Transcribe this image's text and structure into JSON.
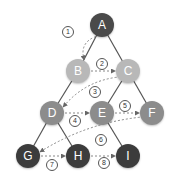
{
  "diagram": {
    "type": "tree-bfs-traversal",
    "colors": {
      "level0": "#4a4a4a",
      "level1": "#b8b8b8",
      "level2": "#8c8c8c",
      "level3": "#3c3c3c",
      "edge": "#555555",
      "arrow": "#888888"
    },
    "nodes": [
      {
        "id": "A",
        "label": "A",
        "x": 102,
        "y": 25,
        "level": 0
      },
      {
        "id": "B",
        "label": "B",
        "x": 78,
        "y": 71,
        "level": 1
      },
      {
        "id": "C",
        "label": "C",
        "x": 128,
        "y": 71,
        "level": 1
      },
      {
        "id": "D",
        "label": "D",
        "x": 52,
        "y": 113,
        "level": 2
      },
      {
        "id": "E",
        "label": "E",
        "x": 102,
        "y": 113,
        "level": 2
      },
      {
        "id": "F",
        "label": "F",
        "x": 152,
        "y": 113,
        "level": 2
      },
      {
        "id": "G",
        "label": "G",
        "x": 28,
        "y": 156,
        "level": 3
      },
      {
        "id": "H",
        "label": "H",
        "x": 78,
        "y": 156,
        "level": 3
      },
      {
        "id": "I",
        "label": "I",
        "x": 128,
        "y": 156,
        "level": 3
      }
    ],
    "edges": [
      [
        "A",
        "B"
      ],
      [
        "A",
        "C"
      ],
      [
        "B",
        "D"
      ],
      [
        "C",
        "E"
      ],
      [
        "C",
        "F"
      ],
      [
        "D",
        "G"
      ],
      [
        "D",
        "H"
      ],
      [
        "E",
        "I"
      ]
    ],
    "steps": [
      {
        "label": "①",
        "from": "A",
        "to": "B",
        "lx": 68,
        "ly": 32
      },
      {
        "label": "②",
        "from": "B",
        "to": "C",
        "lx": 102,
        "ly": 64
      },
      {
        "label": "③",
        "from": "C",
        "to": "D",
        "lx": 95,
        "ly": 92
      },
      {
        "label": "④",
        "from": "D",
        "to": "E",
        "lx": 75,
        "ly": 121
      },
      {
        "label": "⑤",
        "from": "E",
        "to": "F",
        "lx": 125,
        "ly": 106
      },
      {
        "label": "⑥",
        "from": "F",
        "to": "G",
        "lx": 101,
        "ly": 140
      },
      {
        "label": "⑦",
        "from": "G",
        "to": "H",
        "lx": 52,
        "ly": 165
      },
      {
        "label": "⑧",
        "from": "H",
        "to": "I",
        "lx": 104,
        "ly": 163
      }
    ]
  }
}
